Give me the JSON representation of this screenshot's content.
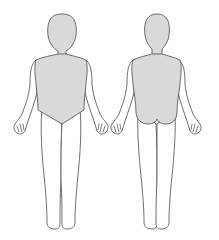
{
  "diagram": {
    "type": "body-map",
    "views": [
      {
        "id": "front",
        "label": "",
        "shaded_region": "torso-front"
      },
      {
        "id": "back",
        "label": "",
        "shaded_region": "torso-back"
      }
    ],
    "colors": {
      "shade": "#d9d9d9",
      "outline": "#4a4a4a",
      "background": "#ffffff"
    }
  }
}
